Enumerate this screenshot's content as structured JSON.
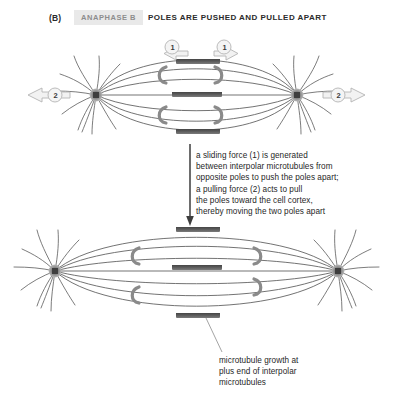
{
  "header": {
    "panel_letter": "(B)",
    "phase_label": "ANAPHASE B",
    "title": "POLES ARE PUSHED AND PULLED APART"
  },
  "annotations": {
    "force_text": "a sliding force (1) is generated\nbetween interpolar microtubules from\nopposite poles to push the poles apart;\na pulling force (2) acts to pull\nthe poles toward the cell cortex,\nthereby moving the two poles apart",
    "growth_text": "microtubule growth at\nplus end of interpolar\nmicrotubules"
  },
  "force_labels": {
    "sliding_left": "1",
    "sliding_right": "1",
    "pulling_left": "2",
    "pulling_right": "2"
  },
  "colors": {
    "chip_background": "#e9e9e9",
    "chip_text": "#8d8d8d",
    "title_text": "#2b2b2b",
    "microtubule": "#5a5a5a",
    "chromosome": "#6e6e6e",
    "chromosome_dark": "#4a4a4a",
    "pole": "#9a9a9a",
    "pole_core": "#4f4f4f",
    "motor": "#8a8a8a",
    "arrow_fill": "#f2f2f2",
    "arrow_stroke": "#b4b4b4",
    "leader": "#8d8d8d",
    "background": "#ffffff"
  },
  "stages": [
    {
      "name": "early-anaphase-b-spindle",
      "pole_left_x": 96,
      "pole_right_x": 297,
      "pole_y": 95,
      "chromosome_count": 3,
      "motor_count": 4
    },
    {
      "name": "late-anaphase-b-spindle",
      "pole_left_x": 55,
      "pole_right_x": 338,
      "pole_y": 271,
      "chromosome_count": 3,
      "motor_count": 4
    }
  ]
}
